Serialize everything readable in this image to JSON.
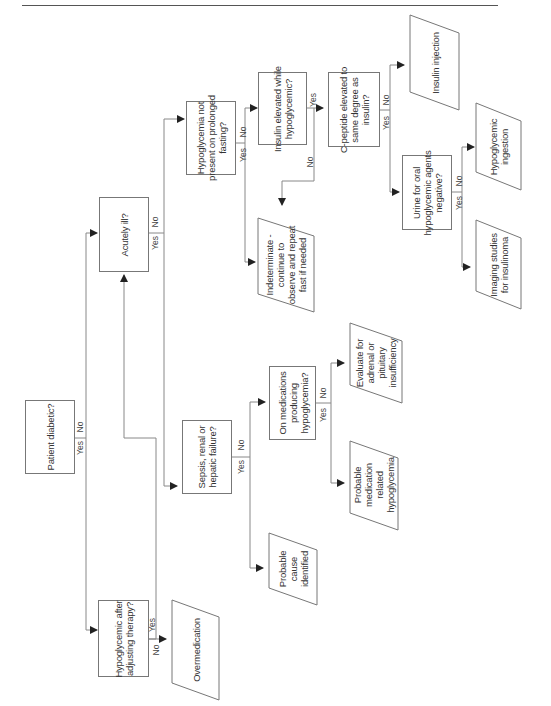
{
  "page": {
    "header_text": ""
  },
  "flowchart": {
    "orientation": "rotated-90-ccw",
    "line_color": "#777777",
    "nodes": {
      "patient_diabetic": "Patient diabetic?",
      "hypo_after_adjusting": "Hypoglycemic after\nadjusting therapy?",
      "overmedication": "Overmedication",
      "acutely_ill": "Acutely ill?",
      "sepsis": "Sepsis, renal or\nhepatic failure?",
      "probable_cause": "Probable\ncause\nidentified",
      "on_medications": "On medications\nproducing\nhypoglycemia?",
      "probable_medication": "Probable\nmedication\nrelated\nhypoglycemia",
      "evaluate_adrenal": "Evaluate for\nadrenal or\npituitary\ninsufficiency",
      "hypo_not_present": "Hypoglycemia not\npresent on prolonged\nfasting?",
      "indeterminate": "Indeterminate -\ncontinue to\nobserve and repeat\nfast if needed",
      "insulin_elevated": "Insulin elevated while\nhypoglycemic?",
      "c_peptide": "C-peptide elevated to\nsame degree as\ninsulin?",
      "insulin_injection": "Insulin injection",
      "urine_oral": "Urine for oral\nhypoglycemic agents\nnegative?",
      "hypoglycemic_ingestion": "Hypoglycemic\ningestion",
      "imaging_studies": "Imaging studies\nfor insulinoma"
    },
    "labels": {
      "yes": "Yes",
      "no": "No"
    }
  }
}
